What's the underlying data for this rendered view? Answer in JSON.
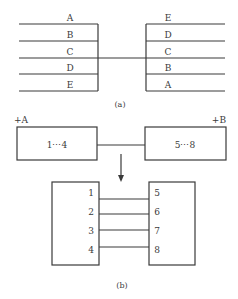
{
  "figure_a": {
    "caption": "(a)",
    "left_labels": [
      "A",
      "B",
      "C",
      "D",
      "E"
    ],
    "right_labels": [
      "E",
      "D",
      "C",
      "B",
      "A"
    ]
  },
  "figure_b": {
    "caption": "(b)",
    "device_a": {
      "tag": "+A",
      "range": "1⋯4"
    },
    "device_b": {
      "tag": "+B",
      "range": "5⋯8"
    },
    "left_terminals": [
      "1",
      "2",
      "3",
      "4"
    ],
    "right_terminals": [
      "5",
      "6",
      "7",
      "8"
    ],
    "arrow": "down-arrow"
  }
}
